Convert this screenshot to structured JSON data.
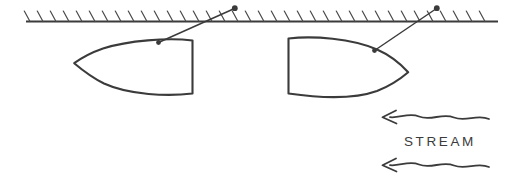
{
  "canvas": {
    "width": 515,
    "height": 186,
    "background_color": "#ffffff",
    "ink_color": "#3b3b3b"
  },
  "diagram": {
    "title_text": "",
    "labels": {
      "stream": "STREAM"
    },
    "boundary": {
      "name": "hatched-boundary-line",
      "y": 21,
      "x_start": 26,
      "x_end": 498,
      "hatch_count": 36,
      "hatch_spacing": 13,
      "hatch_length": 11,
      "hatch_slant": "\\"
    },
    "bodies": [
      {
        "name": "left-body",
        "orientation": "nose-left",
        "nose_x": 74,
        "nose_y": 63,
        "back_x": 192,
        "top_y": 40,
        "bottom_y": 93
      },
      {
        "name": "right-body",
        "orientation": "nose-right",
        "nose_x": 408,
        "nose_y": 72,
        "front_x": 288,
        "top_y": 38,
        "bottom_y": 93
      }
    ],
    "leaders": [
      {
        "name": "left-leader",
        "from_x": 158,
        "from_y": 42,
        "to_x": 235,
        "to_y": 8
      },
      {
        "name": "right-leader",
        "from_x": 374,
        "from_y": 50,
        "to_x": 437,
        "to_y": 8
      }
    ],
    "stream_arrows": [
      {
        "name": "stream-arrow-upper",
        "direction": "left",
        "y": 117,
        "x_tail": 489,
        "x_head": 382
      },
      {
        "name": "stream-arrow-lower",
        "direction": "left",
        "y": 165,
        "x_tail": 489,
        "x_head": 382
      }
    ]
  }
}
